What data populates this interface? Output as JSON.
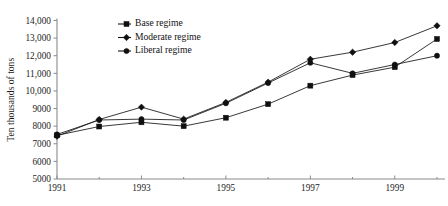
{
  "chart_data": {
    "type": "line",
    "title": "",
    "xlabel": "",
    "ylabel": "Ten thousands of tons",
    "x": [
      1991,
      1992,
      1993,
      1994,
      1995,
      1996,
      1997,
      1998,
      1999,
      2000
    ],
    "xlim": [
      1991,
      2000
    ],
    "ylim": [
      5000,
      14000
    ],
    "ytick_labels": [
      "5000",
      "6000",
      "7000",
      "8000",
      "9000",
      "10,000",
      "11,000",
      "12,000",
      "13,000",
      "14,000"
    ],
    "ytick_values": [
      5000,
      6000,
      7000,
      8000,
      9000,
      10000,
      11000,
      12000,
      13000,
      14000
    ],
    "xtick_labels": [
      "1991",
      "1993",
      "1995",
      "1997",
      "1999"
    ],
    "xtick_values": [
      1991,
      1993,
      1995,
      1997,
      1999
    ],
    "xminor_values": [
      1992,
      1994,
      1996,
      1998,
      2000
    ],
    "grid": false,
    "legend_position": "top-center",
    "series": [
      {
        "name": "Base regime",
        "marker": "square",
        "values": [
          7480,
          7980,
          8220,
          8000,
          8480,
          9250,
          10300,
          10900,
          11350,
          12950
        ]
      },
      {
        "name": "Moderate regime",
        "marker": "diamond",
        "values": [
          7430,
          8380,
          9080,
          8400,
          9350,
          10500,
          11800,
          12200,
          12750,
          13700
        ]
      },
      {
        "name": "Liberal regime",
        "marker": "circle",
        "values": [
          7530,
          8350,
          8400,
          8350,
          9300,
          10450,
          11600,
          11000,
          11500,
          12000
        ]
      }
    ]
  },
  "legend": {
    "items": [
      {
        "label": "Base regime"
      },
      {
        "label": "Moderate regime"
      },
      {
        "label": "Liberal regime"
      }
    ]
  },
  "axes": {
    "y_axis_title": "Ten thousands of tons"
  },
  "caption": {
    "text": ""
  },
  "colors": {
    "ink": "#141414",
    "axis": "#8a8a8a",
    "background": "#ffffff"
  }
}
